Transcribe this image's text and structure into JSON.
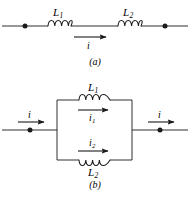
{
  "figure": {
    "stroke_color": "#1a1a1a",
    "background_color": "#ffffff",
    "panels": [
      {
        "id": "a",
        "caption": "(a)",
        "type": "series",
        "components": [
          {
            "name": "L",
            "subscript": "1"
          },
          {
            "name": "L",
            "subscript": "2"
          }
        ],
        "currents": [
          {
            "name": "i",
            "subscript": ""
          }
        ]
      },
      {
        "id": "b",
        "caption": "(b)",
        "type": "parallel",
        "components": [
          {
            "name": "L",
            "subscript": "1"
          },
          {
            "name": "L",
            "subscript": "2"
          }
        ],
        "currents": [
          {
            "name": "i",
            "subscript": ""
          },
          {
            "name": "i",
            "subscript": "1"
          },
          {
            "name": "i",
            "subscript": "2"
          },
          {
            "name": "i",
            "subscript": ""
          }
        ]
      }
    ],
    "labels": {
      "a_L1": "L",
      "a_L1_sub": "1",
      "a_L2": "L",
      "a_L2_sub": "2",
      "a_i": "i",
      "a_caption": "(a)",
      "b_L1": "L",
      "b_L1_sub": "1",
      "b_L2": "L",
      "b_L2_sub": "2",
      "b_i_left": "i",
      "b_i_right": "i",
      "b_i1": "i",
      "b_i1_sub": "1",
      "b_i2": "i",
      "b_i2_sub": "2",
      "b_caption": "(b)"
    }
  }
}
